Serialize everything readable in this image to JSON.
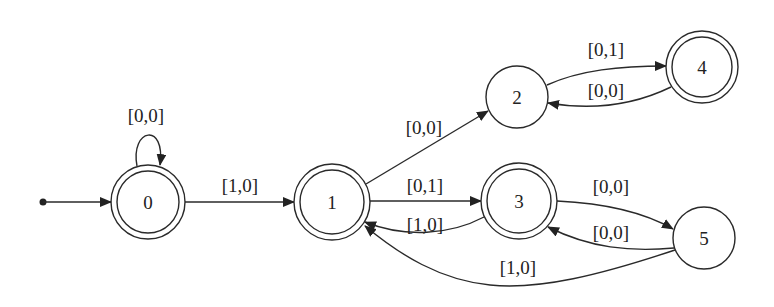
{
  "diagram": {
    "type": "finite-state-automaton",
    "colors": {
      "stroke": "#2a2a2a",
      "background": "#ffffff",
      "text": "#222222"
    },
    "start": {
      "dot": {
        "x": 43,
        "y": 202
      },
      "target": "0"
    },
    "nodes": [
      {
        "id": "0",
        "label": "0",
        "x": 148,
        "y": 202,
        "r": 37,
        "accepting": true
      },
      {
        "id": "1",
        "label": "1",
        "x": 332,
        "y": 202,
        "r": 38,
        "accepting": true
      },
      {
        "id": "2",
        "label": "2",
        "x": 517,
        "y": 97,
        "r": 31,
        "accepting": false
      },
      {
        "id": "3",
        "label": "3",
        "x": 519,
        "y": 201,
        "r": 38,
        "accepting": true
      },
      {
        "id": "4",
        "label": "4",
        "x": 702,
        "y": 67,
        "r": 36,
        "accepting": true
      },
      {
        "id": "5",
        "label": "5",
        "x": 704,
        "y": 238,
        "r": 31,
        "accepting": false
      }
    ],
    "edges": [
      {
        "from": "0",
        "to": "0",
        "label": "[0,0]",
        "path": "M 137 166 C 130 128, 166 122, 160 165",
        "label_pos": {
          "x": 146,
          "y": 122
        }
      },
      {
        "from": "0",
        "to": "1",
        "label": "[1,0]",
        "path": "M 185 202 L 294 202",
        "label_pos": {
          "x": 240,
          "y": 192
        }
      },
      {
        "from": "1",
        "to": "2",
        "label": "[0,0]",
        "path": "M 366 184 L 488 111",
        "label_pos": {
          "x": 424,
          "y": 134
        }
      },
      {
        "from": "2",
        "to": "4",
        "label": "[0,1]",
        "path": "M 547 85 C 580 70, 620 66, 666 66",
        "label_pos": {
          "x": 606,
          "y": 56
        }
      },
      {
        "from": "4",
        "to": "2",
        "label": "[0,0]",
        "path": "M 671 87 C 630 107, 590 110, 548 103",
        "label_pos": {
          "x": 606,
          "y": 97
        }
      },
      {
        "from": "1",
        "to": "3",
        "label": "[0,1]",
        "path": "M 370 201 L 481 201",
        "label_pos": {
          "x": 425,
          "y": 192
        }
      },
      {
        "from": "3",
        "to": "1",
        "label": "[1,0]",
        "path": "M 484 217 C 450 235, 405 238, 365 222",
        "label_pos": {
          "x": 425,
          "y": 231
        }
      },
      {
        "from": "3",
        "to": "5",
        "label": "[0,0]",
        "path": "M 557 201 C 600 203, 640 210, 673 229",
        "label_pos": {
          "x": 611,
          "y": 193
        }
      },
      {
        "from": "5",
        "to": "3",
        "label": "[0,0]",
        "path": "M 674 248 C 630 252, 590 248, 548 227",
        "label_pos": {
          "x": 611,
          "y": 239
        }
      },
      {
        "from": "5",
        "to": "1",
        "label": "[1,0]",
        "path": "M 675 250 C 600 275, 540 290, 490 285 C 440 280, 400 255, 365 226",
        "label_pos": {
          "x": 518,
          "y": 274
        }
      }
    ]
  }
}
